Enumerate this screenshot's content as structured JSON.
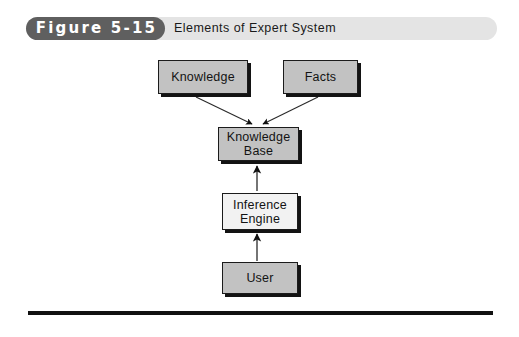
{
  "figure": {
    "badge_label": "Figure 5-15",
    "title": "Elements of Expert System"
  },
  "diagram": {
    "nodes": [
      {
        "id": "knowledge",
        "label": "Knowledge",
        "fill": "#c2c2c2"
      },
      {
        "id": "facts",
        "label": "Facts",
        "fill": "#c2c2c2"
      },
      {
        "id": "knowledge_base",
        "label": "Knowledge\nBase",
        "fill": "#c2c2c2"
      },
      {
        "id": "inference",
        "label": "Inference\nEngine",
        "fill": "#f2f2f2"
      },
      {
        "id": "user",
        "label": "User",
        "fill": "#c2c2c2"
      }
    ],
    "node_labels": {
      "knowledge": "Knowledge",
      "facts": "Facts",
      "knowledge_base_line1": "Knowledge",
      "knowledge_base_line2": "Base",
      "inference_line1": "Inference",
      "inference_line2": "Engine",
      "user": "User"
    },
    "edges": [
      {
        "from": "knowledge",
        "to": "knowledge_base",
        "arrow": "to",
        "style": "diagonal"
      },
      {
        "from": "facts",
        "to": "knowledge_base",
        "arrow": "to",
        "style": "diagonal"
      },
      {
        "from": "inference",
        "to": "knowledge_base",
        "arrow": "to",
        "style": "vertical"
      },
      {
        "from": "user",
        "to": "inference",
        "arrow": "to",
        "style": "vertical"
      }
    ]
  },
  "colors": {
    "banner_bar": "#e4e4e4",
    "badge": "#5f5f5f",
    "badge_text": "#ffffff",
    "box_gray": "#c2c2c2",
    "box_light": "#f2f2f2",
    "outline": "#1b1b1b",
    "shadow": "#131313",
    "rule": "#111111",
    "background": "#ffffff"
  }
}
